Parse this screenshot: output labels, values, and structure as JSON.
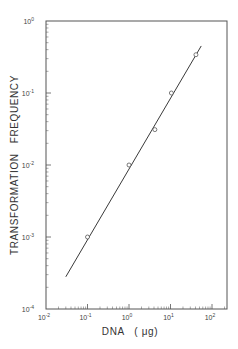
{
  "chart_data": {
    "type": "line",
    "title": "",
    "xlabel": "DNA (μg)",
    "ylabel": "TRANSFORMATION FREQUENCY",
    "xscale": "log",
    "yscale": "log",
    "xlim": [
      0.01,
      220
    ],
    "ylim": [
      0.0001,
      1
    ],
    "grid": false,
    "legend": null,
    "x_ticks": [
      "10^-2",
      "10^-1",
      "10^0",
      "10^1",
      "10^2"
    ],
    "y_ticks": [
      "10^-4",
      "10^-3",
      "10^-2",
      "10^-1",
      "10^0"
    ],
    "series": [
      {
        "name": "observed",
        "style": "open-circle markers",
        "x": [
          0.1,
          1.0,
          4.2,
          10.5,
          41
        ],
        "y": [
          0.001,
          0.01,
          0.031,
          0.1,
          0.34
        ]
      },
      {
        "name": "fit line",
        "style": "solid line",
        "x": [
          0.03,
          55
        ],
        "y": [
          0.00028,
          0.45
        ]
      }
    ]
  },
  "labels": {
    "xlabel": "DNA   ( μg)",
    "ylabel": "TRANSFORMATION   FREQUENCY",
    "x_tick_base": "10",
    "x_tick_exps": [
      "-2",
      "-1",
      "0",
      "1",
      "2"
    ],
    "y_tick_base": "10",
    "y_tick_exps": [
      "0",
      "-1",
      "-2",
      "-3",
      "-4"
    ]
  },
  "colors": {
    "line": "#3a3a3a",
    "frame": "#555555",
    "text": "#333333"
  }
}
